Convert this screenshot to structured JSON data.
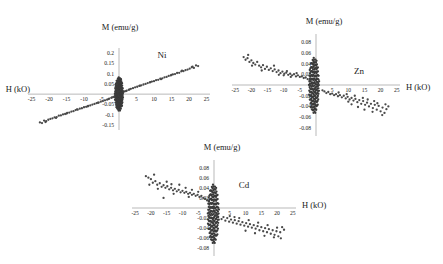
{
  "figure": {
    "background": "#ffffff",
    "marker_color": "#4a4a4a",
    "axis_color": "#b9b9b9"
  },
  "chart_data": [
    {
      "type": "scatter",
      "id": "ni",
      "title": "",
      "series_label": "Ni",
      "xlabel": "H (kO)",
      "ylabel": "M (emu/g)",
      "xlim": [
        -26,
        26
      ],
      "ylim": [
        -0.175,
        0.225
      ],
      "xticks": [
        -25,
        -20,
        -15,
        -10,
        -5,
        5,
        10,
        15,
        20,
        25
      ],
      "yticks": [
        0.2,
        0.15,
        0.1,
        0.05,
        -0.05,
        -0.1,
        -0.15
      ],
      "xtick_labels": [
        "-25",
        "-20",
        "-15",
        "-10",
        "-5",
        "5",
        "10",
        "15",
        "20",
        "25"
      ],
      "ytick_labels": [
        "0.2",
        "0.15",
        "0.1",
        "0.05",
        "-0.05",
        "-0.1",
        "-0.15"
      ],
      "grid": false,
      "legend": "none",
      "trend": "positive-linear",
      "points": [
        [
          -22.6,
          -0.138
        ],
        [
          -22.0,
          -0.141
        ],
        [
          -21.4,
          -0.129
        ],
        [
          -20.8,
          -0.132
        ],
        [
          -20.2,
          -0.125
        ],
        [
          -19.6,
          -0.121
        ],
        [
          -19.0,
          -0.118
        ],
        [
          -18.4,
          -0.113
        ],
        [
          -17.8,
          -0.112
        ],
        [
          -17.2,
          -0.105
        ],
        [
          -16.6,
          -0.104
        ],
        [
          -16.0,
          -0.099
        ],
        [
          -15.4,
          -0.097
        ],
        [
          -14.8,
          -0.092
        ],
        [
          -14.2,
          -0.09
        ],
        [
          -13.6,
          -0.085
        ],
        [
          -13.0,
          -0.083
        ],
        [
          -12.4,
          -0.078
        ],
        [
          -11.8,
          -0.076
        ],
        [
          -11.2,
          -0.071
        ],
        [
          -10.6,
          -0.069
        ],
        [
          -10.0,
          -0.064
        ],
        [
          -9.4,
          -0.062
        ],
        [
          -8.8,
          -0.058
        ],
        [
          -8.2,
          -0.055
        ],
        [
          -7.6,
          -0.051
        ],
        [
          -7.0,
          -0.048
        ],
        [
          -6.4,
          -0.044
        ],
        [
          -5.8,
          -0.041
        ],
        [
          -5.2,
          -0.037
        ],
        [
          -4.6,
          -0.034
        ],
        [
          -4.0,
          -0.03
        ],
        [
          -3.4,
          -0.027
        ],
        [
          -2.8,
          -0.022
        ],
        [
          -2.2,
          -0.018
        ],
        [
          -1.6,
          -0.014
        ],
        [
          -1.0,
          -0.009
        ],
        [
          -0.5,
          -0.005
        ],
        [
          0.0,
          0.0
        ],
        [
          0.5,
          0.004
        ],
        [
          1.0,
          0.008
        ],
        [
          1.6,
          0.013
        ],
        [
          2.2,
          0.017
        ],
        [
          2.8,
          0.021
        ],
        [
          3.4,
          0.026
        ],
        [
          4.0,
          0.029
        ],
        [
          4.6,
          0.033
        ],
        [
          5.2,
          0.036
        ],
        [
          5.8,
          0.04
        ],
        [
          6.4,
          0.043
        ],
        [
          7.0,
          0.047
        ],
        [
          7.6,
          0.05
        ],
        [
          8.2,
          0.054
        ],
        [
          8.8,
          0.057
        ],
        [
          9.4,
          0.061
        ],
        [
          10.0,
          0.063
        ],
        [
          10.6,
          0.068
        ],
        [
          11.2,
          0.07
        ],
        [
          11.8,
          0.075
        ],
        [
          12.4,
          0.077
        ],
        [
          13.0,
          0.082
        ],
        [
          13.6,
          0.084
        ],
        [
          14.2,
          0.089
        ],
        [
          14.8,
          0.091
        ],
        [
          15.4,
          0.096
        ],
        [
          16.0,
          0.098
        ],
        [
          16.6,
          0.103
        ],
        [
          17.2,
          0.104
        ],
        [
          17.8,
          0.111
        ],
        [
          18.4,
          0.112
        ],
        [
          19.0,
          0.117
        ],
        [
          19.6,
          0.12
        ],
        [
          20.2,
          0.124
        ],
        [
          20.8,
          0.131
        ],
        [
          21.4,
          0.128
        ],
        [
          22.0,
          0.14
        ],
        [
          22.6,
          0.137
        ],
        [
          -21.0,
          -0.136
        ],
        [
          -18.0,
          -0.116
        ],
        [
          -15.0,
          -0.095
        ],
        [
          -12.0,
          -0.074
        ],
        [
          -9.0,
          -0.06
        ],
        [
          -6.0,
          -0.042
        ],
        [
          -3.0,
          -0.024
        ],
        [
          3.0,
          0.023
        ],
        [
          6.0,
          0.041
        ],
        [
          9.0,
          0.059
        ],
        [
          12.0,
          0.073
        ],
        [
          15.0,
          0.094
        ],
        [
          18.0,
          0.115
        ],
        [
          21.0,
          0.134
        ],
        [
          -2.0,
          -0.016
        ],
        [
          -1.2,
          -0.011
        ],
        [
          1.2,
          0.01
        ],
        [
          2.0,
          0.015
        ],
        [
          -0.8,
          -0.007
        ],
        [
          0.8,
          0.006
        ],
        [
          -0.3,
          -0.002
        ],
        [
          0.3,
          0.002
        ]
      ],
      "dense_cluster": {
        "x": 0,
        "y": 0,
        "radius": 1.2
      }
    },
    {
      "type": "scatter",
      "id": "zn",
      "title": "",
      "series_label": "Zn",
      "xlabel": "H (kO)",
      "ylabel": "M (emu/g)",
      "xlim": [
        -26,
        26
      ],
      "ylim": [
        -0.095,
        0.095
      ],
      "xticks": [
        -25,
        -20,
        -15,
        -10,
        -5,
        5,
        10,
        15,
        20,
        25
      ],
      "yticks": [
        0.08,
        0.06,
        0.04,
        0.02,
        -0.02,
        -0.04,
        -0.06,
        -0.08
      ],
      "xtick_labels": [
        "-25",
        "-20",
        "-15",
        "-10",
        "-5",
        "5",
        "10",
        "15",
        "20",
        "25"
      ],
      "ytick_labels": [
        "0.08",
        "0.06",
        "0.04",
        "0.02",
        "-0.02",
        "-0.04",
        "-0.06",
        "-0.08"
      ],
      "grid": false,
      "legend": "none",
      "trend": "negative-scatter",
      "points": [
        [
          -22.4,
          0.052
        ],
        [
          -21.8,
          0.047
        ],
        [
          -21.2,
          0.05
        ],
        [
          -20.6,
          0.043
        ],
        [
          -20.0,
          0.046
        ],
        [
          -19.4,
          0.041
        ],
        [
          -18.8,
          0.038
        ],
        [
          -18.2,
          0.043
        ],
        [
          -17.6,
          0.036
        ],
        [
          -17.0,
          0.033
        ],
        [
          -16.4,
          0.037
        ],
        [
          -15.8,
          0.03
        ],
        [
          -15.2,
          0.034
        ],
        [
          -14.6,
          0.028
        ],
        [
          -14.0,
          0.031
        ],
        [
          -13.4,
          0.026
        ],
        [
          -12.8,
          0.029
        ],
        [
          -12.2,
          0.024
        ],
        [
          -11.6,
          0.027
        ],
        [
          -11.0,
          0.022
        ],
        [
          -10.4,
          0.025
        ],
        [
          -9.8,
          0.021
        ],
        [
          -9.2,
          0.023
        ],
        [
          -8.6,
          0.019
        ],
        [
          -8.0,
          0.021
        ],
        [
          -7.4,
          0.018
        ],
        [
          -6.8,
          0.02
        ],
        [
          -6.2,
          0.016
        ],
        [
          -5.6,
          0.018
        ],
        [
          -5.0,
          0.015
        ],
        [
          -4.4,
          0.016
        ],
        [
          -3.8,
          0.013
        ],
        [
          -3.2,
          0.014
        ],
        [
          -2.6,
          0.011
        ],
        [
          -2.0,
          0.009
        ],
        [
          -13.0,
          0.036
        ],
        [
          -11.5,
          0.019
        ],
        [
          -16.8,
          0.027
        ],
        [
          -19.8,
          0.036
        ],
        [
          -21.0,
          0.056
        ],
        [
          -10.0,
          0.018
        ],
        [
          -7.8,
          0.015
        ],
        [
          -9.0,
          0.026
        ],
        [
          -6.0,
          0.022
        ],
        [
          2.0,
          -0.01
        ],
        [
          2.6,
          -0.012
        ],
        [
          3.2,
          -0.015
        ],
        [
          3.8,
          -0.013
        ],
        [
          4.4,
          -0.017
        ],
        [
          5.0,
          -0.016
        ],
        [
          5.6,
          -0.019
        ],
        [
          6.2,
          -0.017
        ],
        [
          6.8,
          -0.021
        ],
        [
          7.4,
          -0.019
        ],
        [
          8.0,
          -0.023
        ],
        [
          8.6,
          -0.02
        ],
        [
          9.2,
          -0.025
        ],
        [
          9.8,
          -0.022
        ],
        [
          10.4,
          -0.027
        ],
        [
          11.0,
          -0.024
        ],
        [
          11.6,
          -0.029
        ],
        [
          12.2,
          -0.026
        ],
        [
          12.8,
          -0.032
        ],
        [
          13.4,
          -0.028
        ],
        [
          14.0,
          -0.035
        ],
        [
          14.6,
          -0.03
        ],
        [
          15.2,
          -0.037
        ],
        [
          15.8,
          -0.033
        ],
        [
          16.4,
          -0.04
        ],
        [
          17.0,
          -0.035
        ],
        [
          17.6,
          -0.043
        ],
        [
          18.2,
          -0.037
        ],
        [
          18.8,
          -0.046
        ],
        [
          19.4,
          -0.039
        ],
        [
          20.0,
          -0.049
        ],
        [
          20.6,
          -0.042
        ],
        [
          21.2,
          -0.052
        ],
        [
          21.8,
          -0.045
        ],
        [
          22.4,
          -0.04
        ],
        [
          7.0,
          -0.014
        ],
        [
          9.5,
          -0.017
        ],
        [
          12.0,
          -0.02
        ],
        [
          14.5,
          -0.024
        ],
        [
          16.0,
          -0.027
        ],
        [
          18.0,
          -0.03
        ],
        [
          19.0,
          -0.034
        ],
        [
          13.0,
          -0.041
        ],
        [
          15.0,
          -0.046
        ],
        [
          17.5,
          -0.05
        ],
        [
          20.5,
          -0.056
        ],
        [
          21.5,
          -0.036
        ],
        [
          10.0,
          -0.031
        ],
        [
          11.0,
          -0.036
        ]
      ],
      "dense_cluster": {
        "x": -0.6,
        "y": -0.001,
        "radius": 1.6
      }
    },
    {
      "type": "scatter",
      "id": "cd",
      "title": "",
      "series_label": "Cd",
      "xlabel": "H (kO)",
      "ylabel": "M (emu/g)",
      "xlim": [
        -26,
        26
      ],
      "ylim": [
        -0.095,
        0.095
      ],
      "xticks": [
        -25,
        -20,
        -15,
        -10,
        -5,
        5,
        10,
        15,
        20,
        25
      ],
      "yticks": [
        0.08,
        0.06,
        0.04,
        0.02,
        -0.02,
        -0.04,
        -0.06,
        -0.08
      ],
      "xtick_labels": [
        "-25",
        "-20",
        "-15",
        "-10",
        "-5",
        "5",
        "10",
        "15",
        "20",
        "25"
      ],
      "ytick_labels": [
        "0.08",
        "0.06",
        "0.04",
        "0.02",
        "-0.02",
        "-0.04",
        "-0.06",
        "-0.08"
      ],
      "grid": false,
      "legend": "none",
      "trend": "negative-scatter",
      "points": [
        [
          -21.6,
          0.063
        ],
        [
          -20.8,
          0.06
        ],
        [
          -20.0,
          0.057
        ],
        [
          -19.4,
          0.05
        ],
        [
          -18.6,
          0.053
        ],
        [
          -18.0,
          0.046
        ],
        [
          -17.2,
          0.049
        ],
        [
          -16.6,
          0.042
        ],
        [
          -16.0,
          0.045
        ],
        [
          -15.4,
          0.04
        ],
        [
          -14.8,
          0.043
        ],
        [
          -14.2,
          0.037
        ],
        [
          -13.6,
          0.04
        ],
        [
          -13.0,
          0.035
        ],
        [
          -12.4,
          0.038
        ],
        [
          -11.8,
          0.033
        ],
        [
          -11.2,
          0.036
        ],
        [
          -10.6,
          0.031
        ],
        [
          -10.0,
          0.034
        ],
        [
          -9.4,
          0.03
        ],
        [
          -8.8,
          0.032
        ],
        [
          -8.2,
          0.028
        ],
        [
          -7.6,
          0.03
        ],
        [
          -7.0,
          0.026
        ],
        [
          -6.4,
          0.028
        ],
        [
          -5.8,
          0.024
        ],
        [
          -5.2,
          0.026
        ],
        [
          -4.6,
          0.022
        ],
        [
          -4.0,
          0.024
        ],
        [
          -3.4,
          0.02
        ],
        [
          -2.8,
          0.018
        ],
        [
          -2.2,
          0.015
        ],
        [
          -1.6,
          0.013
        ],
        [
          -19.0,
          0.066
        ],
        [
          -17.8,
          0.038
        ],
        [
          -15.0,
          0.052
        ],
        [
          -12.8,
          0.028
        ],
        [
          -11.0,
          0.046
        ],
        [
          -16.0,
          0.02
        ],
        [
          -9.0,
          0.04
        ],
        [
          -13.5,
          0.047
        ],
        [
          -20.5,
          0.046
        ],
        [
          -7.0,
          0.036
        ],
        [
          -5.0,
          0.032
        ],
        [
          -8.0,
          0.022
        ],
        [
          2.4,
          -0.022
        ],
        [
          3.0,
          -0.018
        ],
        [
          3.6,
          -0.025
        ],
        [
          4.2,
          -0.02
        ],
        [
          4.8,
          -0.027
        ],
        [
          5.4,
          -0.023
        ],
        [
          6.0,
          -0.029
        ],
        [
          6.6,
          -0.024
        ],
        [
          7.2,
          -0.031
        ],
        [
          7.8,
          -0.026
        ],
        [
          8.4,
          -0.033
        ],
        [
          9.0,
          -0.028
        ],
        [
          9.6,
          -0.035
        ],
        [
          10.2,
          -0.03
        ],
        [
          10.8,
          -0.037
        ],
        [
          11.4,
          -0.032
        ],
        [
          12.0,
          -0.039
        ],
        [
          12.6,
          -0.034
        ],
        [
          13.2,
          -0.041
        ],
        [
          13.8,
          -0.036
        ],
        [
          14.4,
          -0.044
        ],
        [
          15.0,
          -0.038
        ],
        [
          15.6,
          -0.046
        ],
        [
          16.2,
          -0.04
        ],
        [
          16.8,
          -0.048
        ],
        [
          17.4,
          -0.042
        ],
        [
          18.0,
          -0.051
        ],
        [
          18.6,
          -0.044
        ],
        [
          19.2,
          -0.053
        ],
        [
          19.8,
          -0.046
        ],
        [
          20.4,
          -0.056
        ],
        [
          21.0,
          -0.048
        ],
        [
          21.6,
          -0.038
        ],
        [
          22.2,
          -0.043
        ],
        [
          8.0,
          -0.02
        ],
        [
          11.0,
          -0.024
        ],
        [
          14.0,
          -0.029
        ],
        [
          17.0,
          -0.034
        ],
        [
          20.0,
          -0.039
        ],
        [
          10.0,
          -0.045
        ],
        [
          13.0,
          -0.05
        ],
        [
          16.0,
          -0.055
        ],
        [
          19.0,
          -0.058
        ],
        [
          21.2,
          -0.06
        ],
        [
          5.0,
          -0.016
        ],
        [
          6.5,
          -0.018
        ]
      ],
      "dense_cluster": {
        "x": -0.2,
        "y": -0.012,
        "radius": 1.8
      }
    }
  ]
}
